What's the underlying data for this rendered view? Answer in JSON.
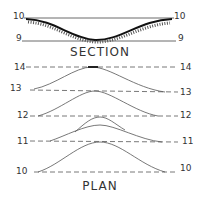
{
  "section": {
    "title": "SECTION",
    "top_left": "10",
    "top_right": "10",
    "bottom_left": "9",
    "bottom_right": "9"
  },
  "plan": {
    "title": "PLAN",
    "contours": [
      {
        "left": "14",
        "right": "14"
      },
      {
        "left": "13",
        "right": "13"
      },
      {
        "left": "12",
        "right": "12"
      },
      {
        "left": "11",
        "right": "11"
      },
      {
        "left": "10",
        "right": "10"
      }
    ]
  },
  "colors": {
    "ink": "#222222"
  }
}
